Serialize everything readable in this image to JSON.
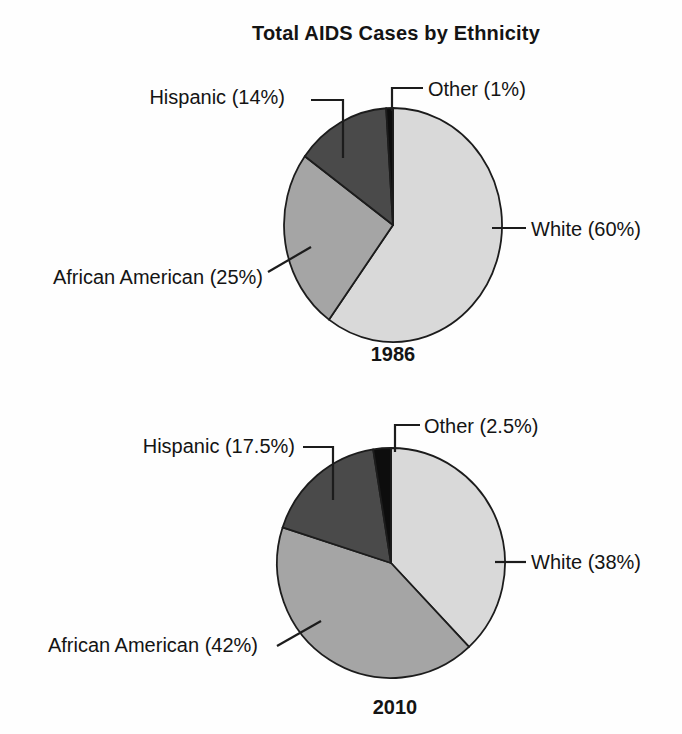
{
  "title": "Total AIDS Cases by Ethnicity",
  "text_color": "#141414",
  "outline_color": "#1c1c1c",
  "chart_data": [
    {
      "type": "pie",
      "title": "1986",
      "units": "percent",
      "start_angle": "12 o'clock",
      "direction": "clockwise",
      "legend_position": "callout-labels",
      "slices": [
        {
          "name": "White",
          "value": 60,
          "label": "White (60%)",
          "color": "#d9d9d9"
        },
        {
          "name": "African American",
          "value": 25,
          "label": "African American (25%)",
          "color": "#a5a5a5"
        },
        {
          "name": "Hispanic",
          "value": 14,
          "label": "Hispanic (14%)",
          "color": "#4a4a4a"
        },
        {
          "name": "Other",
          "value": 1,
          "label": "Other (1%)",
          "color": "#0d0d0d"
        }
      ]
    },
    {
      "type": "pie",
      "title": "2010",
      "units": "percent",
      "start_angle": "12 o'clock",
      "direction": "clockwise",
      "legend_position": "callout-labels",
      "slices": [
        {
          "name": "White",
          "value": 38,
          "label": "White (38%)",
          "color": "#d9d9d9"
        },
        {
          "name": "African American",
          "value": 42,
          "label": "African American (42%)",
          "color": "#a5a5a5"
        },
        {
          "name": "Hispanic",
          "value": 17.5,
          "label": "Hispanic (17.5%)",
          "color": "#4a4a4a"
        },
        {
          "name": "Other",
          "value": 2.5,
          "label": "Other (2.5%)",
          "color": "#0d0d0d"
        }
      ]
    }
  ]
}
